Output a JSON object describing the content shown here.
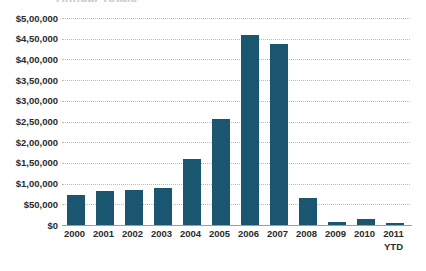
{
  "title": {
    "text": "Annual Totals",
    "visible_partially": true
  },
  "chart_data": {
    "type": "bar",
    "title": "",
    "xlabel": "",
    "ylabel": "",
    "categories": [
      "2000",
      "2001",
      "2002",
      "2003",
      "2004",
      "2005",
      "2006",
      "2007",
      "2008",
      "2009",
      "2010",
      "2011\nYTD"
    ],
    "values": [
      72000,
      82000,
      85000,
      90000,
      160000,
      255000,
      458000,
      437000,
      65000,
      8000,
      15000,
      4000
    ],
    "ylim": [
      0,
      500000
    ],
    "ytick_values": [
      0,
      50000,
      100000,
      150000,
      200000,
      250000,
      300000,
      350000,
      400000,
      450000,
      500000
    ],
    "ytick_labels": [
      "$0",
      "$50,000",
      "$1,00,000",
      "$1,50,000",
      "$2,00,000",
      "$2,50,000",
      "$3,00,000",
      "$3,50,000",
      "$4,00,000",
      "$4,50,000",
      "$5,00,000"
    ],
    "grid": true,
    "grid_style": "dotted",
    "legend": false,
    "bar_color": "#1a5670",
    "gridline_color": "#b9bbbd",
    "axis_color": "#9b9ea1",
    "background_color": "#ffffff",
    "text_color": "#2b2b2b"
  }
}
